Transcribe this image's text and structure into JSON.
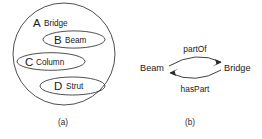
{
  "figure": {
    "background_color": "#ffffff",
    "stroke_color": "#3b3b3b",
    "text_color": "#1a1a1a"
  },
  "panel_a": {
    "caption": "(a)",
    "outer": {
      "letter": "A",
      "word": "Bridge"
    },
    "inner": [
      {
        "letter": "B",
        "word": "Beam"
      },
      {
        "letter": "C",
        "word": "Column"
      },
      {
        "letter": "D",
        "word": "Strut"
      }
    ]
  },
  "panel_b": {
    "caption": "(b)",
    "nodes": [
      {
        "label": "Beam"
      },
      {
        "label": "Bridge"
      }
    ],
    "edges": [
      {
        "label": "partOf",
        "from": "Beam",
        "to": "Bridge",
        "position": "above"
      },
      {
        "label": "hasPart",
        "from": "Bridge",
        "to": "Beam",
        "position": "below"
      }
    ]
  }
}
